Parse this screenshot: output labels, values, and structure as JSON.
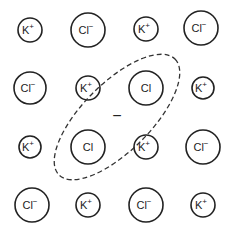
{
  "diagram": {
    "title": "",
    "ions": [
      {
        "symbol": "K",
        "charge": "+",
        "x": 30,
        "y": 30,
        "r": 12
      },
      {
        "symbol": "Cl",
        "charge": "−",
        "x": 88,
        "y": 30,
        "r": 17
      },
      {
        "symbol": "K",
        "charge": "+",
        "x": 146,
        "y": 29,
        "r": 12
      },
      {
        "symbol": "Cl",
        "charge": "−",
        "x": 201,
        "y": 28,
        "r": 17
      },
      {
        "symbol": "Cl",
        "charge": "−",
        "x": 30,
        "y": 88,
        "r": 16
      },
      {
        "symbol": "K",
        "charge": "+",
        "x": 88,
        "y": 88,
        "r": 12
      },
      {
        "symbol": "Cl",
        "charge": "",
        "x": 146,
        "y": 88,
        "r": 17
      },
      {
        "symbol": "K",
        "charge": "+",
        "x": 203,
        "y": 88,
        "r": 11
      },
      {
        "symbol": "K",
        "charge": "+",
        "x": 30,
        "y": 147,
        "r": 11
      },
      {
        "symbol": "Cl",
        "charge": "",
        "x": 88,
        "y": 147,
        "r": 17
      },
      {
        "symbol": "K",
        "charge": "+",
        "x": 146,
        "y": 147,
        "r": 12
      },
      {
        "symbol": "Cl",
        "charge": "−",
        "x": 203,
        "y": 147,
        "r": 17
      },
      {
        "symbol": "Cl",
        "charge": "−",
        "x": 32,
        "y": 205,
        "r": 17
      },
      {
        "symbol": "K",
        "charge": "+",
        "x": 88,
        "y": 205,
        "r": 12
      },
      {
        "symbol": "Cl",
        "charge": "−",
        "x": 146,
        "y": 205,
        "r": 17
      },
      {
        "symbol": "K",
        "charge": "+",
        "x": 203,
        "y": 205,
        "r": 12
      }
    ],
    "defect_region": {
      "shape": "dashed-ellipse",
      "cx": 117,
      "cy": 117,
      "rx": 82,
      "ry": 34,
      "rotation": -45,
      "center_label": "−"
    },
    "colors": {
      "stroke": "#222222",
      "background": "#ffffff"
    }
  }
}
